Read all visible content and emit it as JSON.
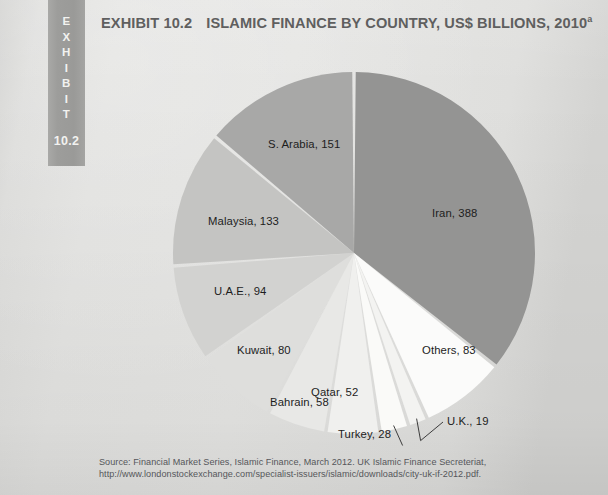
{
  "exhibit_tab": {
    "label_letters": [
      "E",
      "X",
      "H",
      "I",
      "B",
      "I",
      "T"
    ],
    "label": "EXHIBIT",
    "number": "10.2"
  },
  "title": {
    "exhibit_no": "EXHIBIT 10.2",
    "text": "ISLAMIC FINANCE BY COUNTRY, US$ BILLIONS, 2010",
    "footnote_marker": "a",
    "full": "EXHIBIT 10.2  ISLAMIC FINANCE BY COUNTRY, US$ BILLIONS, 2010a"
  },
  "source": {
    "text": "Source: Financial Market Series, Islamic Finance, March 2012. UK Islamic Finance Secreteriat, http://www.londonstockexchange.com/specialist-issuers/islamic/downloads/city-uk-if-2012.pdf."
  },
  "chart_data": {
    "type": "pie",
    "unit": "US$ Billions",
    "year": "2010",
    "total": 1086,
    "start_angle_deg": 0,
    "direction": "clockwise",
    "legend": "none (labels drawn on/next to slices)",
    "categories": [
      "Iran",
      "Others",
      "U.K.",
      "Turkey",
      "Qatar",
      "Bahrain",
      "Kuwait",
      "U.A.E.",
      "Malaysia",
      "S. Arabia"
    ],
    "values": [
      388,
      83,
      19,
      28,
      52,
      58,
      80,
      94,
      133,
      151
    ],
    "slices": [
      {
        "name": "Iran",
        "value": 388,
        "label": "Iran, 388",
        "color": "#949493",
        "label_x": 432,
        "label_y": 207,
        "leader": false
      },
      {
        "name": "Others",
        "value": 83,
        "label": "Others, 83",
        "color": "#fbfbfa",
        "label_x": 422,
        "label_y": 344,
        "leader": false
      },
      {
        "name": "U.K.",
        "value": 19,
        "label": "U.K., 19",
        "color": "#f3f3f1",
        "label_x": 447,
        "label_y": 415,
        "leader": true
      },
      {
        "name": "Turkey",
        "value": 28,
        "label": "Turkey, 28",
        "color": "#fafaf8",
        "label_x": 338,
        "label_y": 428,
        "leader": true
      },
      {
        "name": "Qatar",
        "value": 52,
        "label": "Qatar, 52",
        "color": "#f0f0ee",
        "label_x": 311,
        "label_y": 386,
        "leader": false
      },
      {
        "name": "Bahrain",
        "value": 58,
        "label": "Bahrain, 58",
        "color": "#e8e8e6",
        "label_x": 270,
        "label_y": 396,
        "leader": false
      },
      {
        "name": "Kuwait",
        "value": 80,
        "label": "Kuwait, 80",
        "color": "#dededc",
        "label_x": 237,
        "label_y": 344,
        "leader": false
      },
      {
        "name": "U.A.E.",
        "value": 94,
        "label": "U.A.E., 94",
        "color": "#d2d2d0",
        "label_x": 214,
        "label_y": 285,
        "leader": false
      },
      {
        "name": "Malaysia",
        "value": 133,
        "label": "Malaysia, 133",
        "color": "#c4c4c2",
        "label_x": 208,
        "label_y": 215,
        "leader": false
      },
      {
        "name": "S. Arabia",
        "value": 151,
        "label": "S. Arabia, 151",
        "color": "#a8a8a7",
        "label_x": 268,
        "label_y": 138,
        "leader": false
      }
    ],
    "geometry": {
      "cx": 354,
      "cy": 253,
      "r": 181,
      "gap_deg": 1.1
    }
  }
}
